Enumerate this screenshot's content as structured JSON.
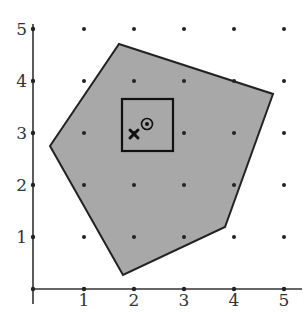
{
  "figure": {
    "type": "lattice-polygon-diagram",
    "x_axis": {
      "ticks": [
        "1",
        "2",
        "3",
        "4",
        "5"
      ],
      "range": [
        0,
        5.4
      ]
    },
    "y_axis": {
      "ticks": [
        "1",
        "2",
        "3",
        "4",
        "5"
      ],
      "range": [
        0,
        5.1
      ]
    },
    "lattice_points": "integer points (1..5, 1..5)",
    "polygon": {
      "vertices": [
        [
          1.7,
          4.7
        ],
        [
          4.8,
          3.7
        ],
        [
          3.8,
          1.2
        ],
        [
          1.8,
          0.3
        ],
        [
          0.35,
          2.75
        ]
      ],
      "fill": "#a8a8a8",
      "stroke": "#222222"
    },
    "square": {
      "x": [
        1.78,
        2.8
      ],
      "y": [
        2.65,
        3.65
      ],
      "stroke": "#111111"
    },
    "circle_marker": {
      "x": 2.28,
      "y": 3.17,
      "label": "target-circle"
    },
    "x_marker": {
      "x": 2.02,
      "y": 2.97,
      "label": "cross-mark"
    }
  }
}
